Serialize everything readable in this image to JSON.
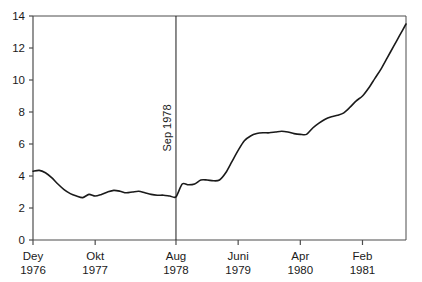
{
  "chart_data": {
    "type": "line",
    "title": "",
    "subtitle": "",
    "xlabel": "",
    "ylabel": "",
    "xlim": [
      0,
      60
    ],
    "ylim": [
      0,
      14
    ],
    "grid": false,
    "legend": null,
    "legend_position": "none",
    "y_ticks": [
      "0",
      "2",
      "4",
      "6",
      "8",
      "10",
      "12",
      "14"
    ],
    "y_tick_values": [
      0,
      2,
      4,
      6,
      8,
      10,
      12,
      14
    ],
    "x_ticks": [
      {
        "month": "Dey",
        "year": "1976",
        "index": 0
      },
      {
        "month": "Okt",
        "year": "1977",
        "index": 10
      },
      {
        "month": "Aug",
        "year": "1978",
        "index": 23
      },
      {
        "month": "Juni",
        "year": "1979",
        "index": 33
      },
      {
        "month": "Apr",
        "year": "1980",
        "index": 43
      },
      {
        "month": "Feb",
        "year": "1981",
        "index": 53
      }
    ],
    "annotations": [
      {
        "type": "vline",
        "label": "Sep 1978",
        "x_index": 23,
        "orientation": "vertical-rotated"
      }
    ],
    "series": [
      {
        "name": "value",
        "color": "#1a1a1a",
        "x": [
          0,
          1,
          2,
          3,
          4,
          5,
          6,
          7,
          8,
          9,
          10,
          11,
          12,
          13,
          14,
          15,
          16,
          17,
          18,
          19,
          20,
          21,
          22,
          23,
          24,
          25,
          26,
          27,
          28,
          29,
          30,
          31,
          32,
          33,
          34,
          35,
          36,
          37,
          38,
          39,
          40,
          41,
          42,
          43,
          44,
          45,
          46,
          47,
          48,
          49,
          50,
          51,
          52,
          53,
          54,
          55,
          56,
          57,
          58,
          59,
          60
        ],
        "values": [
          4.3,
          4.35,
          4.2,
          3.9,
          3.5,
          3.15,
          2.9,
          2.75,
          2.65,
          2.85,
          2.75,
          2.85,
          3.0,
          3.1,
          3.05,
          2.95,
          3.0,
          3.05,
          2.95,
          2.85,
          2.8,
          2.8,
          2.75,
          2.7,
          3.5,
          3.45,
          3.5,
          3.75,
          3.75,
          3.7,
          3.75,
          4.2,
          4.9,
          5.6,
          6.2,
          6.5,
          6.65,
          6.7,
          6.7,
          6.75,
          6.8,
          6.75,
          6.65,
          6.6,
          6.6,
          7.0,
          7.3,
          7.55,
          7.7,
          7.8,
          7.95,
          8.3,
          8.7,
          9.0,
          9.5,
          10.1,
          10.7,
          11.4,
          12.1,
          12.8,
          13.5
        ]
      }
    ]
  },
  "axes": {
    "axis_color": "#4d4d4d",
    "line_color": "#1a1a1a"
  }
}
